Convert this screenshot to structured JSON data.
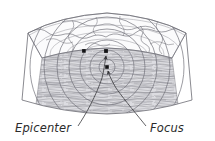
{
  "figure": {
    "background_color": "#ffffff",
    "line_color": "#8d8d93",
    "dark_line_color": "#3a3a3e",
    "marker_color": "#1a1a1a",
    "crust_fill": "#f4f4f6",
    "rock_fill": "#d9d9dd",
    "surface_fill": "#fafafa"
  },
  "labels": {
    "epicenter": "Epicenter",
    "focus": "Focus"
  },
  "markers": [
    {
      "name": "station-marker",
      "x": 84,
      "y": 51,
      "label": ""
    },
    {
      "name": "epicenter-marker",
      "x": 106,
      "y": 51,
      "label": "Epicenter"
    },
    {
      "name": "focus-marker",
      "x": 107,
      "y": 67,
      "label": "Focus"
    }
  ],
  "wave_rings": {
    "name": "seismic-wave-rings",
    "center_x": 107,
    "center_y": 67,
    "count": 8,
    "radii": [
      8,
      17,
      27,
      38,
      50,
      63,
      77,
      92
    ]
  },
  "leader_lines": [
    {
      "name": "epicenter-leader",
      "from": "Epicenter",
      "to_x": 106,
      "to_y": 52
    },
    {
      "name": "focus-leader",
      "from": "Focus",
      "to_x": 107,
      "to_y": 68
    }
  ],
  "layers": {
    "surface_name": "ground-surface-with-coastline",
    "cutaway_name": "rock-strata-cutaway"
  }
}
